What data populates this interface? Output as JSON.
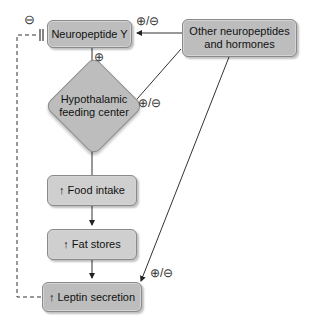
{
  "nodes": {
    "npy": {
      "label": "Neuropeptide Y"
    },
    "other": {
      "line1": "Other neuropeptides",
      "line2": "and hormones"
    },
    "hypothalamic": {
      "line1": "Hypothalamic",
      "line2": "feeding center"
    },
    "food_intake": {
      "arrow": "↑",
      "label": "Food intake"
    },
    "fat_stores": {
      "arrow": "↑",
      "label": "Fat stores"
    },
    "leptin": {
      "arrow": "↑",
      "label": "Leptin secretion"
    }
  },
  "signs": {
    "leptin_to_npy": "⊖",
    "npy_to_hypothalamic": "⊕",
    "other_to_npy": "⊕/⊖",
    "other_to_hypothalamic": "⊕/⊖",
    "other_to_leptin": "⊕/⊖"
  },
  "colors": {
    "box_fill": "#bdbdbd",
    "box_border": "#8a8a8a",
    "line": "#333333"
  }
}
